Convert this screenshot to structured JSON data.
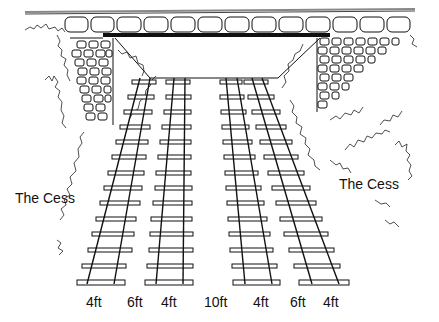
{
  "diagram": {
    "labels": {
      "cess_left": "The Cess",
      "cess_right": "The Cess"
    },
    "dimensions": [
      {
        "label": "4ft",
        "x": 86
      },
      {
        "label": "6ft",
        "x": 127
      },
      {
        "label": "4ft",
        "x": 161
      },
      {
        "label": "10ft",
        "x": 204
      },
      {
        "label": "4ft",
        "x": 253
      },
      {
        "label": "6ft",
        "x": 290
      },
      {
        "label": "4ft",
        "x": 323
      }
    ],
    "colors": {
      "line": "#111111",
      "background": "#ffffff"
    }
  }
}
